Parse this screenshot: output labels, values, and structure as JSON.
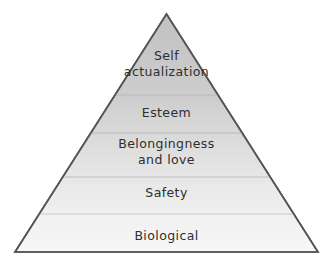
{
  "diagram": {
    "shape": "pyramid",
    "background_color": "#ffffff",
    "outline_color": "#555555",
    "divider_color": "#b9b9b9",
    "text_color": "#2e2e2e",
    "geometry": {
      "apex_x": 166.5,
      "apex_y": 14,
      "base_left_x": 15,
      "base_right_x": 318,
      "base_y": 252,
      "divider_y": [
        95,
        133,
        177,
        214
      ]
    },
    "tiers": [
      {
        "id": "self-actualization",
        "label": "Self actualization",
        "lines": [
          "Self",
          "actualization"
        ],
        "level": 5,
        "fill_color": "#c4c4c4"
      },
      {
        "id": "esteem",
        "label": "Esteem",
        "lines": [
          "Esteem"
        ],
        "level": 4,
        "fill_color": "#cfcfcf"
      },
      {
        "id": "belongingness-and-love",
        "label": "Belongingness and love",
        "lines": [
          "Belongingness",
          "and love"
        ],
        "level": 3,
        "fill_color": "#dadada"
      },
      {
        "id": "safety",
        "label": "Safety",
        "lines": [
          "Safety"
        ],
        "level": 2,
        "fill_color": "#e7e7e7"
      },
      {
        "id": "biological",
        "label": "Biological",
        "lines": [
          "Biological"
        ],
        "level": 1,
        "fill_color": "#f2f2f2"
      }
    ]
  }
}
